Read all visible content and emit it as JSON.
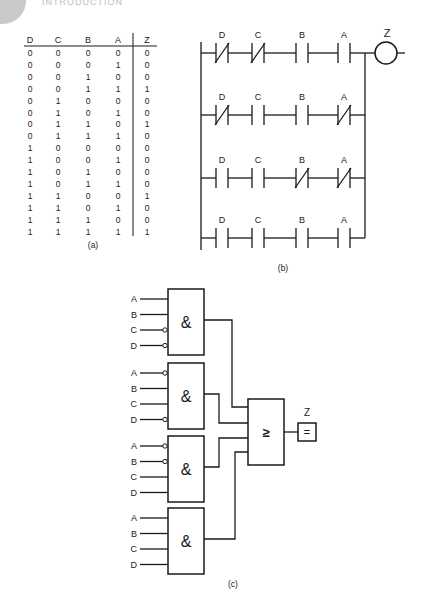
{
  "header": {
    "fragment_text": "INTRODUCTION"
  },
  "truth_table": {
    "caption": "(a)",
    "columns": [
      "D",
      "C",
      "B",
      "A",
      "Z"
    ],
    "rows": [
      [
        "0",
        "0",
        "0",
        "0",
        "0"
      ],
      [
        "0",
        "0",
        "0",
        "1",
        "0"
      ],
      [
        "0",
        "0",
        "1",
        "0",
        "0"
      ],
      [
        "0",
        "0",
        "1",
        "1",
        "1"
      ],
      [
        "0",
        "1",
        "0",
        "0",
        "0"
      ],
      [
        "0",
        "1",
        "0",
        "1",
        "0"
      ],
      [
        "0",
        "1",
        "1",
        "0",
        "1"
      ],
      [
        "0",
        "1",
        "1",
        "1",
        "0"
      ],
      [
        "1",
        "0",
        "0",
        "0",
        "0"
      ],
      [
        "1",
        "0",
        "0",
        "1",
        "0"
      ],
      [
        "1",
        "0",
        "1",
        "0",
        "0"
      ],
      [
        "1",
        "0",
        "1",
        "1",
        "0"
      ],
      [
        "1",
        "1",
        "0",
        "0",
        "1"
      ],
      [
        "1",
        "1",
        "0",
        "1",
        "0"
      ],
      [
        "1",
        "1",
        "1",
        "0",
        "0"
      ],
      [
        "1",
        "1",
        "1",
        "1",
        "1"
      ]
    ]
  },
  "ladder": {
    "caption": "(b)",
    "output_label": "Z",
    "rungs": [
      {
        "contacts": [
          {
            "label": "D",
            "type": "NC"
          },
          {
            "label": "C",
            "type": "NC"
          },
          {
            "label": "B",
            "type": "NO"
          },
          {
            "label": "A",
            "type": "NO"
          }
        ]
      },
      {
        "contacts": [
          {
            "label": "D",
            "type": "NC"
          },
          {
            "label": "C",
            "type": "NO"
          },
          {
            "label": "B",
            "type": "NO"
          },
          {
            "label": "A",
            "type": "NC"
          }
        ]
      },
      {
        "contacts": [
          {
            "label": "D",
            "type": "NO"
          },
          {
            "label": "C",
            "type": "NO"
          },
          {
            "label": "B",
            "type": "NC"
          },
          {
            "label": "A",
            "type": "NC"
          }
        ]
      },
      {
        "contacts": [
          {
            "label": "D",
            "type": "NO"
          },
          {
            "label": "C",
            "type": "NO"
          },
          {
            "label": "B",
            "type": "NO"
          },
          {
            "label": "A",
            "type": "NO"
          }
        ]
      }
    ]
  },
  "logic": {
    "caption": "(c)",
    "and_symbol": "&",
    "or_symbol": "≥",
    "output_symbol": "=",
    "output_label": "Z",
    "gates": [
      {
        "inputs": [
          {
            "label": "A",
            "inverted": false
          },
          {
            "label": "B",
            "inverted": false
          },
          {
            "label": "C",
            "inverted": true
          },
          {
            "label": "D",
            "inverted": true
          }
        ]
      },
      {
        "inputs": [
          {
            "label": "A",
            "inverted": true
          },
          {
            "label": "B",
            "inverted": false
          },
          {
            "label": "C",
            "inverted": false
          },
          {
            "label": "D",
            "inverted": true
          }
        ]
      },
      {
        "inputs": [
          {
            "label": "A",
            "inverted": true
          },
          {
            "label": "B",
            "inverted": true
          },
          {
            "label": "C",
            "inverted": false
          },
          {
            "label": "D",
            "inverted": false
          }
        ]
      },
      {
        "inputs": [
          {
            "label": "A",
            "inverted": false
          },
          {
            "label": "B",
            "inverted": false
          },
          {
            "label": "C",
            "inverted": false
          },
          {
            "label": "D",
            "inverted": false
          }
        ]
      }
    ]
  }
}
